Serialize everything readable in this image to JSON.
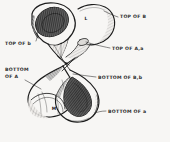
{
  "figure": {
    "background_color": "#f7f6f4",
    "ink_color": "#1d1d1d",
    "shading_color": "#2a2a2a"
  },
  "labels": [
    {
      "id": "top-of-B",
      "text": "TOP OF B",
      "position": "upper-right",
      "x": 120,
      "y": 18,
      "anchor": "start"
    },
    {
      "id": "top-of-A-a",
      "text": "TOP OF A,a",
      "position": "right-upper-middle",
      "x": 112,
      "y": 50,
      "anchor": "start"
    },
    {
      "id": "bottom-of-B-b",
      "text": "BOTTOM OF B,b",
      "position": "right-lower-middle",
      "x": 98,
      "y": 79,
      "anchor": "start"
    },
    {
      "id": "bottom-of-a",
      "text": "BOTTOM OF a",
      "position": "lower-right",
      "x": 108,
      "y": 113,
      "anchor": "start"
    },
    {
      "id": "top-of-b",
      "text": "TOP OF b",
      "position": "left-upper",
      "x": 5,
      "y": 45,
      "anchor": "start"
    },
    {
      "id": "bottom-of-A-line1",
      "text": "BOTTOM",
      "position": "left-lower",
      "x": 5,
      "y": 71,
      "anchor": "start"
    },
    {
      "id": "bottom-of-A-line2",
      "text": "OF A",
      "position": "left-lower",
      "x": 5,
      "y": 78,
      "anchor": "start"
    }
  ],
  "interior_marks": [
    {
      "id": "mark-L",
      "text": "L",
      "x": 86,
      "y": 20,
      "note": "small letter on upper lobe near inner rim"
    },
    {
      "id": "mark-M",
      "text": "M",
      "x": 54,
      "y": 110,
      "note": "small letter on lower lobe surface"
    }
  ]
}
